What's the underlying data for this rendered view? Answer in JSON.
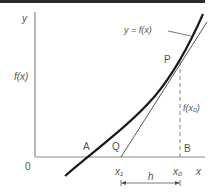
{
  "figure": {
    "colors": {
      "background": "#ffffff",
      "top_bar": "#2b2b2b",
      "axis": "#8a8a8a",
      "curve": "#1a1a1a",
      "tangent": "#444444",
      "dashed": "#777777",
      "text": "#555555"
    },
    "labels": {
      "y_axis": "y",
      "x_axis": "x",
      "origin": "0",
      "fx_axis": "f(x)",
      "curve_label": "y = f(x)",
      "point_p": "P",
      "point_a": "A",
      "point_q": "Q",
      "point_b": "B",
      "fx0": "f(x₀)",
      "x1": "x₁",
      "x0": "x₀",
      "h": "h"
    }
  }
}
